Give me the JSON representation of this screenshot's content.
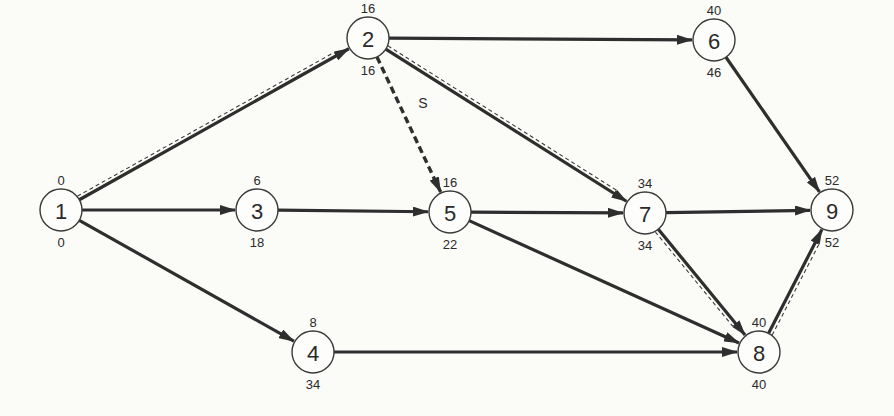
{
  "diagram": {
    "type": "activity-network",
    "colors": {
      "line": "#2e2e2e",
      "background": "#fbfbf8",
      "node_fill": "#fdfdfb"
    },
    "nodes": [
      {
        "id": "1",
        "x": 61,
        "y": 210,
        "top": "0",
        "bottom": "0"
      },
      {
        "id": "2",
        "x": 368,
        "y": 38,
        "top": "16",
        "bottom": "16"
      },
      {
        "id": "3",
        "x": 257,
        "y": 210,
        "top": "6",
        "bottom": "18"
      },
      {
        "id": "4",
        "x": 313,
        "y": 352,
        "top": "8",
        "bottom": "34"
      },
      {
        "id": "5",
        "x": 450,
        "y": 212,
        "top": "16",
        "bottom": "22"
      },
      {
        "id": "6",
        "x": 714,
        "y": 40,
        "top": "40",
        "bottom": "46"
      },
      {
        "id": "7",
        "x": 645,
        "y": 213,
        "top": "34",
        "bottom": "34"
      },
      {
        "id": "8",
        "x": 759,
        "y": 352,
        "top": "40",
        "bottom": "40"
      },
      {
        "id": "9",
        "x": 832,
        "y": 210,
        "top": "52",
        "bottom": "52"
      }
    ],
    "edges": [
      {
        "from": "1",
        "to": "2",
        "critical": true,
        "dummy": false
      },
      {
        "from": "1",
        "to": "3",
        "critical": false,
        "dummy": false
      },
      {
        "from": "1",
        "to": "4",
        "critical": false,
        "dummy": false
      },
      {
        "from": "2",
        "to": "6",
        "critical": false,
        "dummy": false
      },
      {
        "from": "2",
        "to": "5",
        "critical": false,
        "dummy": true,
        "label": "S"
      },
      {
        "from": "2",
        "to": "7",
        "critical": true,
        "dummy": false
      },
      {
        "from": "3",
        "to": "5",
        "critical": false,
        "dummy": false
      },
      {
        "from": "5",
        "to": "7",
        "critical": false,
        "dummy": false
      },
      {
        "from": "5",
        "to": "8",
        "critical": false,
        "dummy": false
      },
      {
        "from": "4",
        "to": "8",
        "critical": false,
        "dummy": false
      },
      {
        "from": "6",
        "to": "9",
        "critical": false,
        "dummy": false
      },
      {
        "from": "7",
        "to": "9",
        "critical": false,
        "dummy": false
      },
      {
        "from": "7",
        "to": "8",
        "critical": true,
        "dummy": false
      },
      {
        "from": "8",
        "to": "9",
        "critical": true,
        "dummy": false
      }
    ]
  }
}
